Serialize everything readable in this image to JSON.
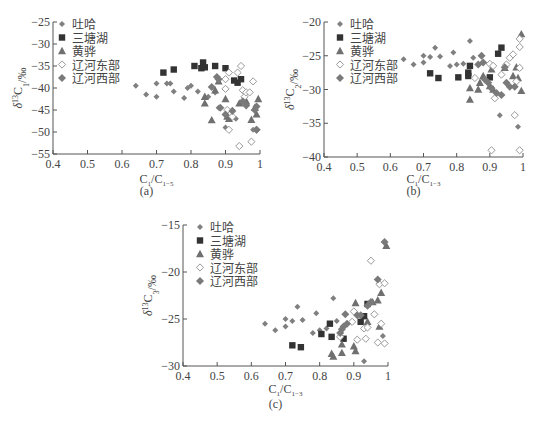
{
  "chart_data": [
    {
      "id": "a",
      "type": "scatter",
      "caption": "(a)",
      "xlabel": "C1/C1-5",
      "ylabel": "δ13C1/‰",
      "xlim": [
        0.4,
        1.0
      ],
      "ylim": [
        -55,
        -25
      ],
      "xticks": [
        0.4,
        0.5,
        0.6,
        0.7,
        0.8,
        0.9,
        1
      ],
      "yticks": [
        -25,
        -30,
        -35,
        -40,
        -45,
        -50,
        -55
      ],
      "grid": false,
      "legend_position": "upper-left",
      "series": [
        {
          "name": "吐哈",
          "marker": "diamond-small",
          "color": "#808080",
          "points": [
            [
              0.64,
              -39.5
            ],
            [
              0.67,
              -41.5
            ],
            [
              0.7,
              -39
            ],
            [
              0.7,
              -42
            ],
            [
              0.73,
              -39
            ],
            [
              0.74,
              -39
            ],
            [
              0.75,
              -40.8
            ],
            [
              0.78,
              -42.3
            ],
            [
              0.79,
              -40
            ],
            [
              0.8,
              -39.5
            ],
            [
              0.82,
              -40.8
            ],
            [
              0.85,
              -42
            ],
            [
              0.87,
              -41
            ],
            [
              0.88,
              -44.5
            ],
            [
              0.9,
              -49
            ],
            [
              0.92,
              -45
            ],
            [
              0.93,
              -47
            ],
            [
              0.98,
              -49.5
            ]
          ]
        },
        {
          "name": "三塘湖",
          "marker": "square",
          "color": "#333333",
          "points": [
            [
              0.72,
              -36.5
            ],
            [
              0.75,
              -35.8
            ],
            [
              0.81,
              -35
            ],
            [
              0.83,
              -35.5
            ],
            [
              0.835,
              -34.2
            ],
            [
              0.84,
              -35.3
            ],
            [
              0.87,
              -35
            ],
            [
              0.9,
              -35.5
            ],
            [
              0.925,
              -38.3
            ],
            [
              0.935,
              -38.8
            ],
            [
              0.945,
              -38
            ]
          ]
        },
        {
          "name": "黄骅",
          "marker": "triangle",
          "color": "#707070",
          "points": [
            [
              0.84,
              -42
            ],
            [
              0.84,
              -43.5
            ],
            [
              0.86,
              -47.3
            ],
            [
              0.87,
              -40.5
            ],
            [
              0.88,
              -38.5
            ],
            [
              0.9,
              -42.5
            ],
            [
              0.905,
              -46.5
            ],
            [
              0.91,
              -47
            ],
            [
              0.94,
              -43.5
            ],
            [
              0.96,
              -43
            ],
            [
              0.975,
              -47.2
            ],
            [
              0.985,
              -44.5
            ],
            [
              0.99,
              -46
            ],
            [
              0.995,
              -42.5
            ]
          ]
        },
        {
          "name": "辽河东部",
          "marker": "diamond-open",
          "color": "#999999",
          "points": [
            [
              0.9,
              -40.2
            ],
            [
              0.9,
              -38
            ],
            [
              0.905,
              -45
            ],
            [
              0.91,
              -36.5
            ],
            [
              0.92,
              -46.5
            ],
            [
              0.94,
              -53.2
            ],
            [
              0.935,
              -36.5
            ],
            [
              0.945,
              -35
            ],
            [
              0.95,
              -40.5
            ],
            [
              0.955,
              -42
            ],
            [
              0.96,
              -41
            ],
            [
              0.97,
              -41
            ],
            [
              0.975,
              -52.2
            ],
            [
              0.98,
              -38.5
            ],
            [
              0.99,
              -49.5
            ],
            [
              0.91,
              -49.5
            ]
          ]
        },
        {
          "name": "辽河西部",
          "marker": "diamond",
          "color": "#7a7a7a",
          "points": [
            [
              0.86,
              -39.8
            ],
            [
              0.875,
              -37.5
            ],
            [
              0.88,
              -38
            ],
            [
              0.885,
              -44.5
            ],
            [
              0.9,
              -46
            ],
            [
              0.92,
              -45.2
            ],
            [
              0.95,
              -43
            ],
            [
              0.96,
              -44
            ],
            [
              0.985,
              -45
            ],
            [
              0.99,
              -44.2
            ],
            [
              0.99,
              -49.5
            ]
          ]
        }
      ]
    },
    {
      "id": "b",
      "type": "scatter",
      "caption": "(b)",
      "xlabel": "C1/C1-3",
      "ylabel": "δ13C2/‰",
      "xlim": [
        0.4,
        1.0
      ],
      "ylim": [
        -40,
        -20
      ],
      "xticks": [
        0.4,
        0.5,
        0.6,
        0.7,
        0.8,
        0.9,
        1
      ],
      "yticks": [
        -20,
        -25,
        -30,
        -35,
        -40
      ],
      "grid": false,
      "legend_position": "upper-left",
      "series": [
        {
          "name": "吐哈",
          "marker": "diamond-small",
          "color": "#808080",
          "points": [
            [
              0.64,
              -25.5
            ],
            [
              0.67,
              -26.3
            ],
            [
              0.7,
              -25
            ],
            [
              0.7,
              -26
            ],
            [
              0.72,
              -25.2
            ],
            [
              0.735,
              -23.8
            ],
            [
              0.75,
              -25.1
            ],
            [
              0.78,
              -26.5
            ],
            [
              0.79,
              -24.5
            ],
            [
              0.8,
              -26.3
            ],
            [
              0.82,
              -26.2
            ],
            [
              0.84,
              -22.8
            ],
            [
              0.85,
              -25.3
            ],
            [
              0.93,
              -33.8
            ],
            [
              0.985,
              -35.5
            ]
          ]
        },
        {
          "name": "三塘湖",
          "marker": "square",
          "color": "#333333",
          "points": [
            [
              0.72,
              -27.6
            ],
            [
              0.745,
              -28.3
            ],
            [
              0.805,
              -28.2
            ],
            [
              0.835,
              -27.5
            ],
            [
              0.835,
              -28
            ],
            [
              0.84,
              -26.5
            ],
            [
              0.9,
              -28.2
            ],
            [
              0.925,
              -24.7
            ],
            [
              0.935,
              -23.8
            ]
          ]
        },
        {
          "name": "黄骅",
          "marker": "triangle",
          "color": "#707070",
          "points": [
            [
              0.84,
              -29.8
            ],
            [
              0.84,
              -31.5
            ],
            [
              0.865,
              -30
            ],
            [
              0.87,
              -29
            ],
            [
              0.88,
              -28
            ],
            [
              0.9,
              -29.5
            ],
            [
              0.905,
              -27
            ],
            [
              0.91,
              -30
            ],
            [
              0.945,
              -26.8
            ],
            [
              0.97,
              -28
            ],
            [
              0.98,
              -26.7
            ],
            [
              0.985,
              -28.3
            ],
            [
              0.995,
              -30.2
            ],
            [
              0.995,
              -21.8
            ]
          ]
        },
        {
          "name": "辽河东部",
          "marker": "diamond-open",
          "color": "#999999",
          "points": [
            [
              0.855,
              -28.3
            ],
            [
              0.9,
              -26.2
            ],
            [
              0.905,
              -39
            ],
            [
              0.91,
              -26.5
            ],
            [
              0.915,
              -31.3
            ],
            [
              0.935,
              -27.8
            ],
            [
              0.95,
              -26.3
            ],
            [
              0.96,
              -25.3
            ],
            [
              0.97,
              -24.8
            ],
            [
              0.975,
              -33.8
            ],
            [
              0.98,
              -28.8
            ],
            [
              0.99,
              -23.7
            ],
            [
              0.99,
              -22.5
            ],
            [
              0.99,
              -26.8
            ],
            [
              0.99,
              -39
            ]
          ]
        },
        {
          "name": "辽河西部",
          "marker": "diamond",
          "color": "#7a7a7a",
          "points": [
            [
              0.865,
              -26.3
            ],
            [
              0.875,
              -25
            ],
            [
              0.88,
              -26
            ],
            [
              0.885,
              -28.5
            ],
            [
              0.895,
              -29
            ],
            [
              0.905,
              -29.8
            ],
            [
              0.92,
              -30.5
            ],
            [
              0.935,
              -30.8
            ],
            [
              0.945,
              -26.7
            ],
            [
              0.95,
              -29
            ],
            [
              0.96,
              -29.6
            ],
            [
              0.975,
              -29.6
            ]
          ]
        }
      ]
    },
    {
      "id": "c",
      "type": "scatter",
      "caption": "(c)",
      "xlabel": "C1/C1-3",
      "ylabel": "δ13C3/‰",
      "xlim": [
        0.4,
        1.0
      ],
      "ylim": [
        -30,
        -15
      ],
      "xticks": [
        0.4,
        0.5,
        0.6,
        0.7,
        0.8,
        0.9,
        1
      ],
      "yticks": [
        -15,
        -20,
        -25,
        -30
      ],
      "grid": false,
      "legend_position": "upper-left",
      "series": [
        {
          "name": "吐哈",
          "marker": "diamond-small",
          "color": "#808080",
          "points": [
            [
              0.64,
              -25.5
            ],
            [
              0.67,
              -26.2
            ],
            [
              0.7,
              -25
            ],
            [
              0.7,
              -25.8
            ],
            [
              0.72,
              -25.2
            ],
            [
              0.735,
              -23.7
            ],
            [
              0.75,
              -25.1
            ],
            [
              0.78,
              -26.5
            ],
            [
              0.79,
              -24.4
            ],
            [
              0.8,
              -26.2
            ],
            [
              0.82,
              -26
            ],
            [
              0.84,
              -22.8
            ],
            [
              0.85,
              -25.2
            ],
            [
              0.93,
              -29.5
            ],
            [
              0.985,
              -26.8
            ]
          ]
        },
        {
          "name": "三塘湖",
          "marker": "square",
          "color": "#333333",
          "points": [
            [
              0.72,
              -27.8
            ],
            [
              0.745,
              -28
            ],
            [
              0.805,
              -26.6
            ],
            [
              0.83,
              -25.5
            ],
            [
              0.835,
              -26.9
            ],
            [
              0.87,
              -27.1
            ],
            [
              0.92,
              -25.3
            ],
            [
              0.93,
              -24.7
            ],
            [
              0.94,
              -23.4
            ]
          ]
        },
        {
          "name": "黄骅",
          "marker": "triangle",
          "color": "#707070",
          "points": [
            [
              0.835,
              -28.7
            ],
            [
              0.84,
              -29
            ],
            [
              0.865,
              -27.7
            ],
            [
              0.865,
              -28.6
            ],
            [
              0.9,
              -27.9
            ],
            [
              0.905,
              -28.4
            ],
            [
              0.905,
              -23.3
            ],
            [
              0.94,
              -25.3
            ],
            [
              0.955,
              -23.2
            ],
            [
              0.97,
              -23
            ],
            [
              0.975,
              -25.8
            ],
            [
              0.98,
              -22.2
            ],
            [
              0.995,
              -17.2
            ]
          ]
        },
        {
          "name": "辽河东部",
          "marker": "diamond-open",
          "color": "#999999",
          "points": [
            [
              0.86,
              -26.9
            ],
            [
              0.895,
              -25.3
            ],
            [
              0.9,
              -24.2
            ],
            [
              0.91,
              -27.2
            ],
            [
              0.93,
              -26
            ],
            [
              0.935,
              -27.1
            ],
            [
              0.94,
              -25.9
            ],
            [
              0.95,
              -18.8
            ],
            [
              0.96,
              -24.5
            ],
            [
              0.97,
              -27.5
            ],
            [
              0.975,
              -21.3
            ],
            [
              0.98,
              -25.5
            ],
            [
              0.99,
              -21.2
            ],
            [
              0.99,
              -27.6
            ]
          ]
        },
        {
          "name": "辽河西部",
          "marker": "diamond",
          "color": "#7a7a7a",
          "points": [
            [
              0.86,
              -26.5
            ],
            [
              0.865,
              -26.1
            ],
            [
              0.87,
              -25.8
            ],
            [
              0.875,
              -24.5
            ],
            [
              0.88,
              -25.5
            ],
            [
              0.91,
              -24.6
            ],
            [
              0.92,
              -24.6
            ],
            [
              0.94,
              -23.6
            ],
            [
              0.95,
              -23.2
            ],
            [
              0.97,
              -20.8
            ],
            [
              0.99,
              -16.8
            ]
          ]
        }
      ]
    }
  ],
  "legend": {
    "items": [
      "吐哈",
      "三塘湖",
      "黄骅",
      "辽河东部",
      "辽河西部"
    ]
  },
  "labels": {
    "a": {
      "caption": "(a)",
      "ylabel_main": "δ",
      "ylabel_sup": "13",
      "ylabel_c": "C",
      "ylabel_sub": "1",
      "ylabel_unit": "/‰",
      "xlabel_c1": "C",
      "xlabel_sub1": "1",
      "xlabel_c2": "/C",
      "xlabel_sub2": "1−5"
    },
    "b": {
      "caption": "(b)",
      "ylabel_main": "δ",
      "ylabel_sup": "13",
      "ylabel_c": "C",
      "ylabel_sub": "2",
      "ylabel_unit": "/‰",
      "xlabel_c1": "C",
      "xlabel_sub1": "1",
      "xlabel_c2": "/C",
      "xlabel_sub2": "1−3"
    },
    "c": {
      "caption": "(c)",
      "ylabel_main": "δ",
      "ylabel_sup": "13",
      "ylabel_c": "C",
      "ylabel_sub": "3",
      "ylabel_unit": "/‰",
      "xlabel_c1": "C",
      "xlabel_sub1": "1",
      "xlabel_c2": "/C",
      "xlabel_sub2": "1−3"
    }
  }
}
